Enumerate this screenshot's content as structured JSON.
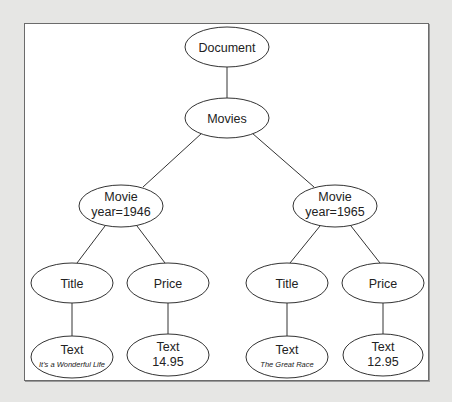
{
  "diagram": {
    "type": "tree",
    "colors": {
      "background": "#e6e6e4",
      "frame": "#ffffff",
      "stroke": "#333333",
      "text": "#222222"
    },
    "nodes": {
      "document": {
        "label": "Document"
      },
      "movies": {
        "label": "Movies"
      },
      "movie1": {
        "label": "Movie",
        "attr": "year=1946"
      },
      "movie2": {
        "label": "Movie",
        "attr": "year=1965"
      },
      "title1": {
        "label": "Title"
      },
      "price1": {
        "label": "Price"
      },
      "title2": {
        "label": "Title"
      },
      "price2": {
        "label": "Price"
      },
      "text1": {
        "label": "Text",
        "value": "It's a Wonderful Life"
      },
      "text2": {
        "label": "Text",
        "value": "14.95"
      },
      "text3": {
        "label": "Text",
        "value": "The Great Race"
      },
      "text4": {
        "label": "Text",
        "value": "12.95"
      }
    },
    "edges": [
      [
        "document",
        "movies"
      ],
      [
        "movies",
        "movie1"
      ],
      [
        "movies",
        "movie2"
      ],
      [
        "movie1",
        "title1"
      ],
      [
        "movie1",
        "price1"
      ],
      [
        "movie2",
        "title2"
      ],
      [
        "movie2",
        "price2"
      ],
      [
        "title1",
        "text1"
      ],
      [
        "price1",
        "text2"
      ],
      [
        "title2",
        "text3"
      ],
      [
        "price2",
        "text4"
      ]
    ]
  }
}
